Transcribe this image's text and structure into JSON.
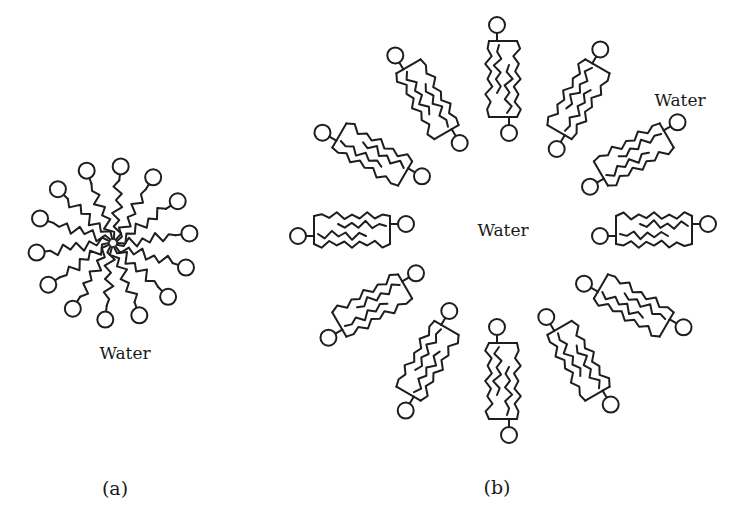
{
  "figure": {
    "background": "#ffffff",
    "ink": "#1e1e1e",
    "panels": [
      {
        "id": "a",
        "caption": "(a)",
        "caption_pos": [
          115,
          488
        ],
        "description": "Spherical micelle",
        "center": [
          113,
          243
        ],
        "head_radius_px": 8,
        "head_orbit_px": 77,
        "molecule_count": 14,
        "water_label": {
          "text": "Water",
          "pos": [
            125,
            353
          ]
        }
      },
      {
        "id": "b",
        "caption": "(b)",
        "caption_pos": [
          497,
          487
        ],
        "description": "Bilayer vesicle",
        "center": [
          503,
          230
        ],
        "head_radius_px": 8,
        "inner_orbit_px": 97,
        "outer_orbit_px": 205,
        "segment_count": 12,
        "water_inner_label": {
          "text": "Water",
          "pos": [
            503,
            230
          ]
        },
        "water_outer_label": {
          "text": "Water",
          "pos": [
            680,
            100
          ]
        }
      }
    ]
  },
  "labels": {
    "a_water": "Water",
    "b_water_inner": "Water",
    "b_water_outer": "Water",
    "a_caption": "(a)",
    "b_caption": "(b)"
  }
}
